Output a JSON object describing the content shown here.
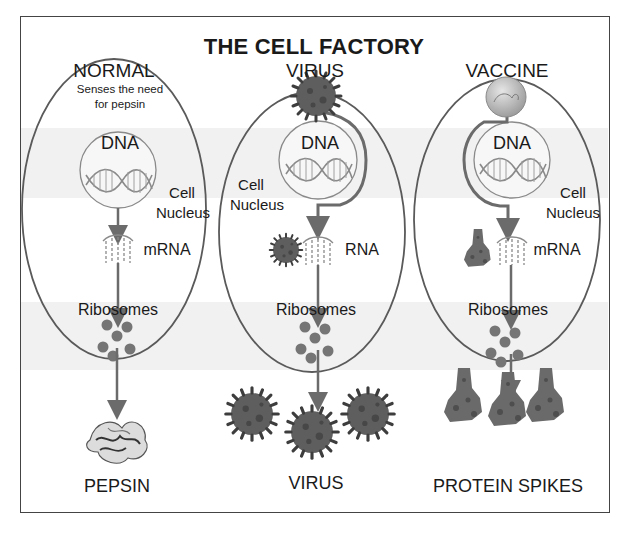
{
  "title": "THE CELL FACTORY",
  "columns": [
    {
      "id": "normal",
      "heading": "NORMAL",
      "note_line1": "Senses the need",
      "note_line2": "for pepsin",
      "nucleus_label": "DNA",
      "cell_label_line1": "Cell",
      "cell_label_line2": "Nucleus",
      "transcript_label": "mRNA",
      "ribosomes_label": "Ribosomes",
      "output_label": "PEPSIN"
    },
    {
      "id": "virus",
      "heading": "VIRUS",
      "nucleus_label": "DNA",
      "cell_label_line1": "Cell",
      "cell_label_line2": "Nucleus",
      "transcript_label": "RNA",
      "ribosomes_label": "Ribosomes",
      "output_label": "VIRUS"
    },
    {
      "id": "vaccine",
      "heading": "VACCINE",
      "nucleus_label": "DNA",
      "cell_label_line1": "Cell",
      "cell_label_line2": "Nucleus",
      "transcript_label": "mRNA",
      "ribosomes_label": "Ribosomes",
      "output_label": "PROTEIN SPIKES"
    }
  ],
  "icons": {
    "dna": "dna-helix-icon",
    "mrna": "mrna-strand-icon",
    "virus": "coronavirus-icon",
    "vaccine": "vaccine-sphere-icon",
    "ribosome": "ribosome-dots-icon",
    "pepsin": "pepsin-protein-icon",
    "spike": "spike-protein-icon"
  },
  "colors": {
    "outline": "#5a5a5a",
    "arrow": "#6b6b6b",
    "ribosome": "#757575",
    "band": "#f1f1f1",
    "virus_body": "#5e5e5e",
    "vaccine_sphere": "#bdbdbd"
  }
}
